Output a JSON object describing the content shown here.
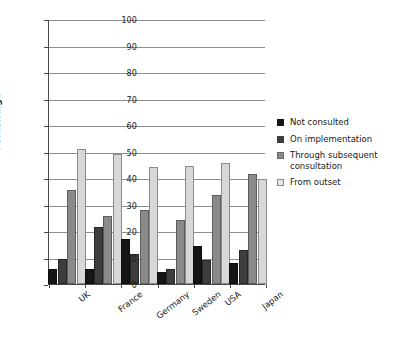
{
  "chart_data": {
    "type": "bar",
    "title": "",
    "xlabel": "",
    "ylabel": "Percentage",
    "ylim": [
      0,
      100
    ],
    "yticks": [
      0,
      10,
      20,
      30,
      40,
      50,
      60,
      70,
      80,
      90,
      100
    ],
    "grid": true,
    "legend_position": "right",
    "categories": [
      "UK",
      "France",
      "Germany",
      "Sweden",
      "USA",
      "Japan"
    ],
    "series": [
      {
        "name": "Not consulted",
        "color": "#161616",
        "values": [
          5.5,
          5.5,
          17,
          4.5,
          14.5,
          8
        ]
      },
      {
        "name": "On implementation",
        "color": "#3e3e3e",
        "values": [
          9.5,
          21.5,
          11.5,
          5.5,
          9,
          13
        ]
      },
      {
        "name": "Through subsequent consultation",
        "color": "#8a8a8a",
        "values": [
          35.5,
          25.5,
          28,
          24,
          33.5,
          41.5
        ]
      },
      {
        "name": "From outset",
        "color": "#d8d8d8",
        "values": [
          51,
          49,
          44,
          44.5,
          45.5,
          39.5
        ]
      }
    ]
  }
}
